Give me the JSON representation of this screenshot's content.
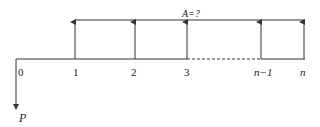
{
  "diagram": {
    "title_label": "A=?",
    "present_value_label": "P",
    "periods": [
      {
        "label": "0",
        "x": 16
      },
      {
        "label": "1",
        "x": 75
      },
      {
        "label": "2",
        "x": 135
      },
      {
        "label": "3",
        "x": 187
      },
      {
        "label": "n−1",
        "x": 261
      },
      {
        "label": "n",
        "x": 304
      }
    ],
    "colors": {
      "line": "#333333",
      "text": "#222222"
    }
  }
}
